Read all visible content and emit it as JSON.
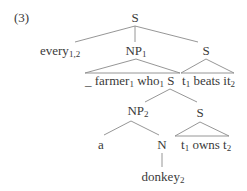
{
  "example_number": "(3)",
  "tree": {
    "root": {
      "label": "S"
    },
    "every": {
      "label": "every",
      "sub": "1,2"
    },
    "np1": {
      "label": "NP",
      "sub": "1"
    },
    "s_right": {
      "label": "S"
    },
    "np1_yield": {
      "gap": "_",
      "farmer": "farmer",
      "farmer_sub": "1",
      "who": "who",
      "who_sub": "1",
      "s": "S"
    },
    "s_right_yield": {
      "t": "t",
      "t_sub": "1",
      "beats": "beats",
      "it": "it",
      "it_sub": "2"
    },
    "np2": {
      "label": "NP",
      "sub": "2"
    },
    "s_lower": {
      "label": "S"
    },
    "det_a": {
      "label": "a"
    },
    "n": {
      "label": "N"
    },
    "s_lower_yield": {
      "t1": "t",
      "t1_sub": "1",
      "owns": "owns",
      "t2": "t",
      "t2_sub": "2"
    },
    "donkey": {
      "label": "donkey",
      "sub": "2"
    }
  }
}
